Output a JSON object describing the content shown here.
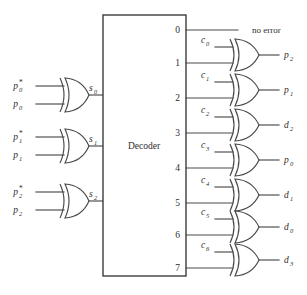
{
  "diagram": {
    "decoder_label": "Decoder",
    "no_error_label": "no error",
    "ink_color": "#4a4a4a",
    "background_color": "#ffffff"
  },
  "syndrome_gates": [
    {
      "gate_name": "xor-gate-s0",
      "input_top_base": "p",
      "input_top_sub": "0",
      "input_top_star": "*",
      "input_bottom_base": "p",
      "input_bottom_sub": "0",
      "output_base": "s",
      "output_sub": "0"
    },
    {
      "gate_name": "xor-gate-s1",
      "input_top_base": "p",
      "input_top_sub": "1",
      "input_top_star": "*",
      "input_bottom_base": "p",
      "input_bottom_sub": "1",
      "output_base": "s",
      "output_sub": "1"
    },
    {
      "gate_name": "xor-gate-s2",
      "input_top_base": "p",
      "input_top_sub": "2",
      "input_top_star": "*",
      "input_bottom_base": "p",
      "input_bottom_sub": "2",
      "output_base": "s",
      "output_sub": "2"
    }
  ],
  "decoder_ports": [
    {
      "number": "0"
    },
    {
      "number": "1"
    },
    {
      "number": "2"
    },
    {
      "number": "3"
    },
    {
      "number": "4"
    },
    {
      "number": "5"
    },
    {
      "number": "6"
    },
    {
      "number": "7"
    }
  ],
  "correction_gates": [
    {
      "gate_name": "xor-gate-c0",
      "decoder_port": "1",
      "input_base": "c",
      "input_sub": "0",
      "output_base": "p",
      "output_sub": "2"
    },
    {
      "gate_name": "xor-gate-c1",
      "decoder_port": "2",
      "input_base": "c",
      "input_sub": "1",
      "output_base": "p",
      "output_sub": "1"
    },
    {
      "gate_name": "xor-gate-c2",
      "decoder_port": "3",
      "input_base": "c",
      "input_sub": "2",
      "output_base": "d",
      "output_sub": "2"
    },
    {
      "gate_name": "xor-gate-c3",
      "decoder_port": "4",
      "input_base": "c",
      "input_sub": "3",
      "output_base": "p",
      "output_sub": "0"
    },
    {
      "gate_name": "xor-gate-c4",
      "decoder_port": "5",
      "input_base": "c",
      "input_sub": "4",
      "output_base": "d",
      "output_sub": "1"
    },
    {
      "gate_name": "xor-gate-c5",
      "decoder_port": "6",
      "input_base": "c",
      "input_sub": "5",
      "output_base": "d",
      "output_sub": "0"
    },
    {
      "gate_name": "xor-gate-c6",
      "decoder_port": "7",
      "input_base": "c",
      "input_sub": "6",
      "output_base": "d",
      "output_sub": "3"
    }
  ]
}
